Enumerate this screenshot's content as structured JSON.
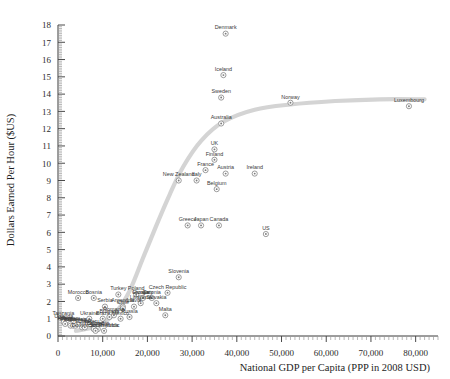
{
  "chart_data": {
    "type": "scatter",
    "title": "",
    "xlabel": "National GDP per Capita (PPP in 2008 USD)",
    "ylabel": "Dollars Earned Per Hour ($US)",
    "xlim": [
      0,
      85000
    ],
    "ylim": [
      0,
      18
    ],
    "xticks": [
      0,
      10000,
      20000,
      30000,
      40000,
      50000,
      60000,
      70000,
      80000
    ],
    "xticklabels": [
      "0",
      "10,000",
      "20,000",
      "30,000",
      "40,000",
      "50,000",
      "60,000",
      "70,000",
      "80,000"
    ],
    "yticks": [
      0,
      1,
      2,
      3,
      4,
      5,
      6,
      7,
      8,
      9,
      10,
      11,
      12,
      13,
      14,
      15,
      16,
      17,
      18
    ],
    "yticklabels": [
      "0",
      "1",
      "2",
      "3",
      "4",
      "5",
      "6",
      "7",
      "8",
      "9",
      "10",
      "11",
      "12",
      "13",
      "14",
      "15",
      "16",
      "17",
      "18"
    ],
    "grid": false,
    "legend": false,
    "marker": "circle-dot",
    "trendline": {
      "present": true,
      "color": "#d4d4d4",
      "shape": "logistic-s-curve",
      "points": [
        [
          4000,
          0.3
        ],
        [
          9000,
          0.6
        ],
        [
          13000,
          1.4
        ],
        [
          16000,
          2.6
        ],
        [
          19000,
          4.5
        ],
        [
          22000,
          6.4
        ],
        [
          25000,
          8.2
        ],
        [
          28000,
          9.8
        ],
        [
          32000,
          11.3
        ],
        [
          37000,
          12.4
        ],
        [
          44000,
          13.1
        ],
        [
          52000,
          13.4
        ],
        [
          62000,
          13.6
        ],
        [
          72000,
          13.7
        ],
        [
          82000,
          13.7
        ]
      ]
    },
    "points": [
      {
        "label": "Denmark",
        "x": 37500,
        "y": 17.5
      },
      {
        "label": "Iceland",
        "x": 37000,
        "y": 15.1
      },
      {
        "label": "Sweden",
        "x": 36500,
        "y": 13.8
      },
      {
        "label": "Norway",
        "x": 52000,
        "y": 13.5
      },
      {
        "label": "Luxembourg",
        "x": 78500,
        "y": 13.3
      },
      {
        "label": "Australia",
        "x": 36500,
        "y": 12.3
      },
      {
        "label": "UK",
        "x": 35000,
        "y": 10.8
      },
      {
        "label": "Finland",
        "x": 35000,
        "y": 10.2
      },
      {
        "label": "France",
        "x": 33000,
        "y": 9.6
      },
      {
        "label": "Austria",
        "x": 37500,
        "y": 9.4
      },
      {
        "label": "New Zealand",
        "x": 27000,
        "y": 9.0
      },
      {
        "label": "Italy",
        "x": 31000,
        "y": 9.0
      },
      {
        "label": "Belgium",
        "x": 35500,
        "y": 8.5
      },
      {
        "label": "Ireland",
        "x": 44000,
        "y": 9.4
      },
      {
        "label": "Greece",
        "x": 29000,
        "y": 6.4
      },
      {
        "label": "Japan",
        "x": 32000,
        "y": 6.4
      },
      {
        "label": "Canada",
        "x": 36000,
        "y": 6.4
      },
      {
        "label": "US",
        "x": 46500,
        "y": 5.9
      },
      {
        "label": "Slovenia",
        "x": 27000,
        "y": 3.4
      },
      {
        "label": "Czech Republic",
        "x": 24500,
        "y": 2.5
      },
      {
        "label": "Poland",
        "x": 17500,
        "y": 2.4
      },
      {
        "label": "Turkey",
        "x": 13500,
        "y": 2.4
      },
      {
        "label": "Croatia",
        "x": 18500,
        "y": 2.2
      },
      {
        "label": "Hungary",
        "x": 19000,
        "y": 2.2
      },
      {
        "label": "Estonia",
        "x": 21000,
        "y": 2.2
      },
      {
        "label": "Bosnia",
        "x": 8000,
        "y": 2.2
      },
      {
        "label": "Morocco",
        "x": 4500,
        "y": 2.2
      },
      {
        "label": "Lithuania",
        "x": 18500,
        "y": 1.9
      },
      {
        "label": "Slovakia",
        "x": 22000,
        "y": 1.9
      },
      {
        "label": "Latvia",
        "x": 17000,
        "y": 1.7
      },
      {
        "label": "Serbia",
        "x": 10500,
        "y": 1.7
      },
      {
        "label": "Argentina",
        "x": 14500,
        "y": 1.7
      },
      {
        "label": "Chile",
        "x": 14500,
        "y": 1.6
      },
      {
        "label": "Malta",
        "x": 24000,
        "y": 1.2
      },
      {
        "label": "Russia",
        "x": 16000,
        "y": 1.1
      },
      {
        "label": "Romania",
        "x": 12500,
        "y": 1.2
      },
      {
        "label": "Bulgaria",
        "x": 11500,
        "y": 1.1
      },
      {
        "label": "Ukraine",
        "x": 7000,
        "y": 1.0
      },
      {
        "label": "Brazil",
        "x": 10000,
        "y": 1.0
      },
      {
        "label": "Mexico",
        "x": 14000,
        "y": 1.0
      },
      {
        "label": "Tanzania",
        "x": 1200,
        "y": 1.0
      },
      {
        "label": "Uganda",
        "x": 1300,
        "y": 0.8
      },
      {
        "label": "Kenya",
        "x": 1600,
        "y": 0.7
      },
      {
        "label": "Vietnam",
        "x": 2700,
        "y": 0.7
      },
      {
        "label": "India",
        "x": 2800,
        "y": 0.6
      },
      {
        "label": "Philippines",
        "x": 3400,
        "y": 0.6
      },
      {
        "label": "Indonesia",
        "x": 3900,
        "y": 0.6
      },
      {
        "label": "Egypt",
        "x": 5400,
        "y": 0.5
      },
      {
        "label": "China",
        "x": 6000,
        "y": 0.5
      },
      {
        "label": "Peru",
        "x": 8000,
        "y": 0.5
      },
      {
        "label": "Colombia",
        "x": 8900,
        "y": 0.4
      },
      {
        "label": "Thailand",
        "x": 8000,
        "y": 0.4
      },
      {
        "label": "Dominican Republic",
        "x": 8400,
        "y": 0.3
      },
      {
        "label": "South Africa",
        "x": 10300,
        "y": 0.3
      }
    ]
  }
}
